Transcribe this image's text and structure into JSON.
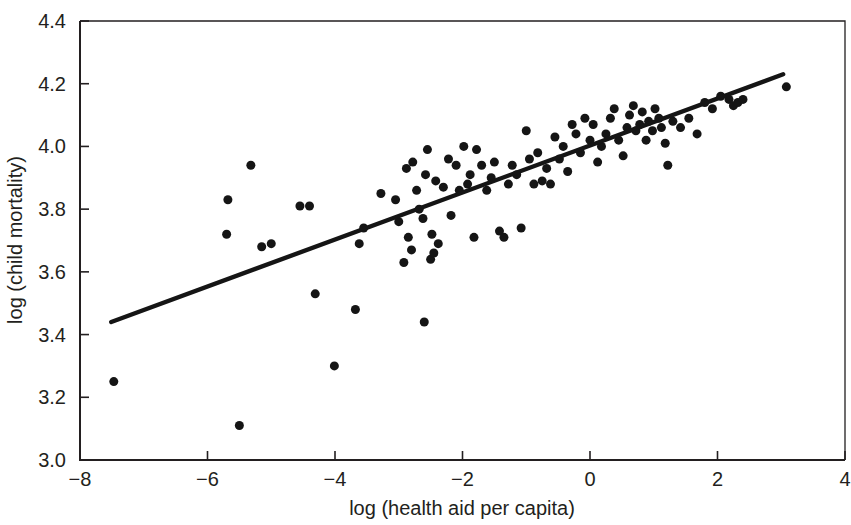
{
  "chart_data": {
    "type": "scatter",
    "title": "",
    "subtitle": "",
    "xlabel": "log (health aid per capita)",
    "ylabel": "log (child mortality)",
    "xlim": [
      -8,
      4
    ],
    "ylim": [
      3.0,
      4.4
    ],
    "xticks": [
      -8,
      -6,
      -4,
      -2,
      0,
      2,
      4
    ],
    "xtick_labels": [
      "−8",
      "−6",
      "−4",
      "−2",
      "0",
      "2",
      "4"
    ],
    "yticks": [
      3.0,
      3.2,
      3.4,
      3.6,
      3.8,
      4.0,
      4.2,
      4.4
    ],
    "ytick_labels": [
      "3.0",
      "3.2",
      "3.4",
      "3.6",
      "3.8",
      "4.0",
      "4.2",
      "4.4"
    ],
    "grid": false,
    "legend": null,
    "marker": {
      "shape": "circle",
      "color": "#151515",
      "size_px": 9
    },
    "series": [
      {
        "name": "countries",
        "type": "scatter",
        "x": [
          -7.47,
          -5.68,
          -5.7,
          -5.32,
          -5.5,
          -5.15,
          -5.0,
          -4.55,
          -4.4,
          -4.31,
          -4.01,
          -3.68,
          -3.62,
          -3.55,
          -3.28,
          -3.05,
          -3.0,
          -2.92,
          -2.88,
          -2.85,
          -2.8,
          -2.78,
          -2.72,
          -2.68,
          -2.62,
          -2.6,
          -2.58,
          -2.55,
          -2.5,
          -2.48,
          -2.45,
          -2.42,
          -2.38,
          -2.3,
          -2.22,
          -2.18,
          -2.1,
          -2.05,
          -1.98,
          -1.92,
          -1.88,
          -1.82,
          -1.78,
          -1.7,
          -1.62,
          -1.55,
          -1.5,
          -1.42,
          -1.35,
          -1.28,
          -1.22,
          -1.15,
          -1.08,
          -1.0,
          -0.95,
          -0.88,
          -0.82,
          -0.75,
          -0.68,
          -0.62,
          -0.55,
          -0.48,
          -0.42,
          -0.35,
          -0.28,
          -0.22,
          -0.15,
          -0.08,
          0.0,
          0.05,
          0.12,
          0.18,
          0.25,
          0.32,
          0.38,
          0.45,
          0.52,
          0.58,
          0.62,
          0.68,
          0.72,
          0.78,
          0.82,
          0.88,
          0.92,
          0.98,
          1.02,
          1.08,
          1.12,
          1.18,
          1.22,
          1.3,
          1.42,
          1.55,
          1.68,
          1.8,
          1.92,
          2.05,
          2.18,
          2.25,
          2.32,
          2.4,
          3.08
        ],
        "y": [
          3.25,
          3.83,
          3.72,
          3.94,
          3.11,
          3.68,
          3.69,
          3.81,
          3.81,
          3.53,
          3.3,
          3.48,
          3.69,
          3.74,
          3.85,
          3.83,
          3.76,
          3.63,
          3.93,
          3.71,
          3.67,
          3.95,
          3.86,
          3.8,
          3.77,
          3.44,
          3.91,
          3.99,
          3.64,
          3.72,
          3.66,
          3.89,
          3.69,
          3.87,
          3.96,
          3.78,
          3.94,
          3.86,
          4.0,
          3.88,
          3.91,
          3.71,
          3.99,
          3.94,
          3.86,
          3.9,
          3.95,
          3.73,
          3.71,
          3.88,
          3.94,
          3.91,
          3.74,
          4.05,
          3.96,
          3.88,
          3.98,
          3.89,
          3.93,
          3.88,
          4.03,
          3.96,
          4.0,
          3.92,
          4.07,
          4.04,
          3.98,
          4.09,
          4.02,
          4.07,
          3.95,
          4.0,
          4.04,
          4.09,
          4.12,
          4.02,
          3.97,
          4.06,
          4.1,
          4.13,
          4.05,
          4.07,
          4.11,
          4.02,
          4.08,
          4.05,
          4.12,
          4.09,
          4.06,
          4.01,
          3.94,
          4.08,
          4.06,
          4.09,
          4.04,
          4.14,
          4.12,
          4.16,
          4.15,
          4.13,
          4.14,
          4.15,
          4.19
        ]
      },
      {
        "name": "fitted regression line",
        "type": "line",
        "x": [
          -7.51,
          3.03
        ],
        "y": [
          3.44,
          4.23
        ]
      }
    ]
  }
}
